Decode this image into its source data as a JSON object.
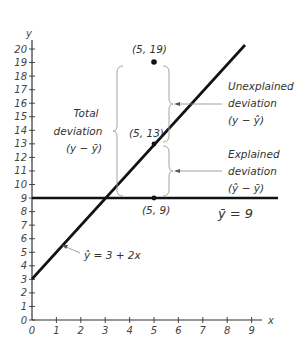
{
  "chart_data": {
    "type": "line",
    "title": "",
    "xlabel": "x",
    "ylabel": "y",
    "xlim": [
      0,
      9
    ],
    "ylim": [
      0,
      20
    ],
    "x_ticks": [
      "0",
      "1",
      "2",
      "3",
      "4",
      "5",
      "6",
      "7",
      "8",
      "9"
    ],
    "y_ticks": [
      "0",
      "1",
      "2",
      "3",
      "4",
      "5",
      "6",
      "7",
      "8",
      "9",
      "10",
      "11",
      "12",
      "13",
      "14",
      "15",
      "16",
      "17",
      "18",
      "19",
      "20"
    ],
    "grid": false,
    "series": [
      {
        "name": "Regression line",
        "equation": "ŷ = 3 + 2x",
        "x": [
          0,
          9
        ],
        "y": [
          3,
          21
        ]
      },
      {
        "name": "Mean line",
        "equation": "ȳ = 9",
        "x": [
          0,
          10
        ],
        "y": [
          9,
          9
        ]
      }
    ],
    "points": [
      {
        "label": "(5, 19)",
        "x": 5,
        "y": 19
      },
      {
        "label": "(5, 13)",
        "x": 5,
        "y": 13
      },
      {
        "label": "(5, 9)",
        "x": 5,
        "y": 9
      }
    ],
    "annotations": [
      {
        "id": "total",
        "lines": [
          "Total",
          "deviation",
          "(y − ȳ)"
        ]
      },
      {
        "id": "unexplained",
        "lines": [
          "Unexplained",
          "deviation",
          "(y − ŷ)"
        ]
      },
      {
        "id": "explained",
        "lines": [
          "Explained",
          "deviation",
          "(ŷ − ȳ)"
        ]
      },
      {
        "id": "mean",
        "lines": [
          "ȳ = 9"
        ]
      },
      {
        "id": "regression",
        "lines": [
          "ŷ = 3 + 2x"
        ]
      }
    ]
  },
  "labels": {
    "x_axis": "x",
    "y_axis": "y",
    "p19": "(5, 19)",
    "p13": "(5, 13)",
    "p9": "(5, 9)",
    "total_1": "Total",
    "total_2": "deviation",
    "total_3": "(y − ȳ)",
    "unexp_1": "Unexplained",
    "unexp_2": "deviation",
    "unexp_3": "(y − ŷ)",
    "exp_1": "Explained",
    "exp_2": "deviation",
    "exp_3": "(ŷ − ȳ)",
    "mean": "ȳ = 9",
    "regression": "ŷ = 3 + 2x"
  }
}
